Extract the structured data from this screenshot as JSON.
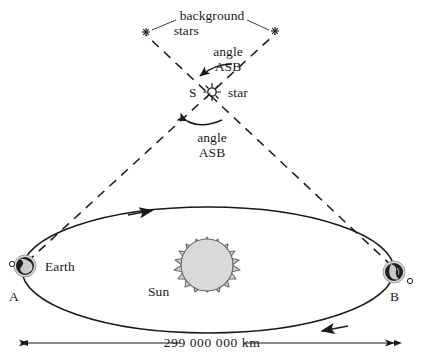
{
  "figure": {
    "title_visible": false,
    "labels": {
      "background_stars_line1": "background",
      "background_stars_line2": "stars",
      "angle_top_line1": "angle",
      "angle_top_line2": "ASB",
      "angle_bottom_line1": "angle",
      "angle_bottom_line2": "ASB",
      "star_point": "S",
      "star_word": "star",
      "earth": "Earth",
      "sun": "Sun",
      "point_a": "A",
      "point_b": "B",
      "distance": "299 000 000 km"
    },
    "icons": {
      "star_glyph": "star-burst-icon",
      "background_star_left": "asterisk-star-icon",
      "background_star_right": "asterisk-star-icon",
      "earth_a": "earth-globe-icon",
      "earth_b": "earth-globe-icon",
      "moon_a": "moon-icon",
      "moon_b": "moon-icon",
      "sun": "sun-icon"
    },
    "colors": {
      "ink": "#1a1a1a",
      "sun_fill": "#d4d4d4",
      "sun_outline": "#555555",
      "earth_fill": "#1f1f1f",
      "earth_halo": "#c9c9c9",
      "background": "#ffffff"
    },
    "geometry": {
      "star_position": [
        212,
        92
      ],
      "earth_a_position": [
        25,
        266
      ],
      "earth_b_position": [
        394,
        272
      ],
      "background_star_left": [
        146,
        32
      ],
      "background_star_right": [
        275,
        31
      ],
      "sun_position": [
        207,
        277
      ],
      "dimension_line_y": 343,
      "dimension_line_x_range": [
        20,
        400
      ]
    }
  }
}
